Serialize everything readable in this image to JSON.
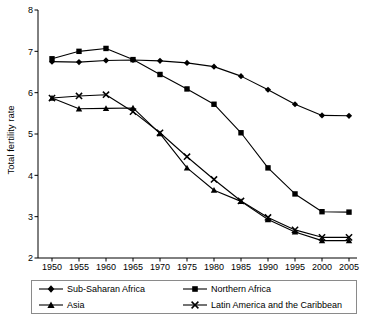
{
  "chart_data": {
    "type": "line",
    "title": "",
    "xlabel": "",
    "ylabel": "Total fertility rate",
    "x": [
      1950,
      1955,
      1960,
      1965,
      1970,
      1975,
      1980,
      1985,
      1990,
      1995,
      2000,
      2005
    ],
    "xtick_labels": [
      "1950",
      "1955",
      "1960",
      "1965",
      "1970",
      "1975",
      "1980",
      "1985",
      "1990",
      "1995",
      "2000",
      "2005"
    ],
    "ytick_labels": [
      "2",
      "3",
      "4",
      "5",
      "6",
      "7",
      "8"
    ],
    "yticks": [
      2,
      3,
      4,
      5,
      6,
      7,
      8
    ],
    "ylim": [
      2,
      8
    ],
    "xlim": [
      1950,
      2005
    ],
    "grid": false,
    "legend_position": "below",
    "series": [
      {
        "name": "Sub-Saharan Africa",
        "marker": "diamond",
        "color": "#000000",
        "values": [
          6.75,
          6.74,
          6.78,
          6.79,
          6.77,
          6.72,
          6.63,
          6.4,
          6.07,
          5.72,
          5.45,
          5.44
        ]
      },
      {
        "name": "Northern Africa",
        "marker": "square",
        "color": "#000000",
        "values": [
          6.82,
          7.0,
          7.07,
          6.8,
          6.44,
          6.09,
          5.72,
          5.03,
          4.18,
          3.55,
          3.12,
          3.11
        ]
      },
      {
        "name": "Asia",
        "marker": "triangle",
        "color": "#000000",
        "values": [
          5.87,
          5.61,
          5.62,
          5.63,
          5.01,
          4.18,
          3.64,
          3.37,
          2.93,
          2.63,
          2.42,
          2.42
        ]
      },
      {
        "name": "Latin America and the Caribbean",
        "marker": "x",
        "color": "#000000",
        "values": [
          5.87,
          5.92,
          5.95,
          5.54,
          5.03,
          4.45,
          3.9,
          3.38,
          2.98,
          2.68,
          2.5,
          2.5
        ]
      }
    ]
  },
  "legend": {
    "entries": [
      {
        "label": "Sub-Saharan Africa",
        "marker": "diamond"
      },
      {
        "label": "Northern Africa",
        "marker": "square"
      },
      {
        "label": "Asia",
        "marker": "triangle"
      },
      {
        "label": "Latin America and the Caribbean",
        "marker": "x"
      }
    ]
  }
}
